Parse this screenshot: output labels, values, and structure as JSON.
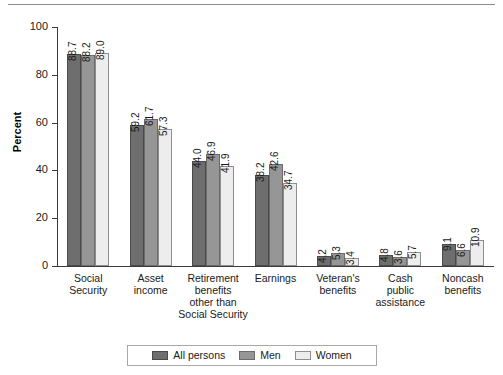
{
  "chart_data": {
    "type": "bar",
    "title": "",
    "xlabel": "",
    "ylabel": "Percent",
    "ylim": [
      0,
      100
    ],
    "yticks": [
      0,
      20,
      40,
      60,
      80,
      100
    ],
    "grid": false,
    "legend_position": "bottom",
    "categories": [
      "Social Security",
      "Asset income",
      "Retirement benefits other than Social Security",
      "Earnings",
      "Veteran's benefits",
      "Cash public assistance",
      "Noncash benefits"
    ],
    "category_lines": [
      [
        "Social",
        "Security"
      ],
      [
        "Asset",
        "income"
      ],
      [
        "Retirement",
        "benefits",
        "other than",
        "Social Security"
      ],
      [
        "Earnings"
      ],
      [
        "Veteran's",
        "benefits"
      ],
      [
        "Cash",
        "public",
        "assistance"
      ],
      [
        "Noncash",
        "benefits"
      ]
    ],
    "series": [
      {
        "name": "All persons",
        "color": "#6e6e6e",
        "values": [
          88.7,
          59.2,
          44.0,
          38.2,
          4.2,
          4.8,
          9.1
        ]
      },
      {
        "name": "Men",
        "color": "#969696",
        "values": [
          88.2,
          61.7,
          46.9,
          42.6,
          5.3,
          3.6,
          6.6
        ]
      },
      {
        "name": "Women",
        "color": "#ededed",
        "values": [
          89.0,
          57.3,
          41.9,
          34.7,
          3.4,
          5.7,
          10.9
        ]
      }
    ]
  },
  "legend": {
    "items": [
      {
        "label": "All persons"
      },
      {
        "label": "Men"
      },
      {
        "label": "Women"
      }
    ]
  }
}
